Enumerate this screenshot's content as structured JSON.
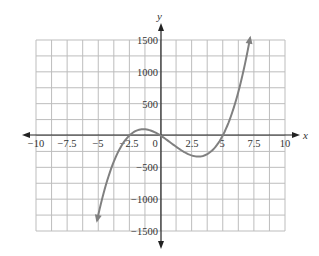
{
  "chart_data": {
    "type": "line",
    "title": "",
    "xlabel": "x",
    "ylabel": "y",
    "xlim": [
      -10,
      10
    ],
    "ylim": [
      -1500,
      1500
    ],
    "grid": true,
    "grid_x_step": 1.25,
    "grid_y_step": 250,
    "x_ticks": [
      -10,
      -7.5,
      -5,
      -2.5,
      0,
      2.5,
      5,
      7.5,
      10
    ],
    "x_tick_labels": [
      "−10",
      "−7.5",
      "−5",
      "−2.5",
      "0",
      "2.5",
      "5",
      "7.5",
      "10"
    ],
    "y_ticks": [
      1500,
      1000,
      500,
      -500,
      -1000,
      -1500
    ],
    "y_tick_labels": [
      "1500",
      "1000",
      "500",
      "−500",
      "−1000",
      "−1500"
    ],
    "legend": [],
    "series": [
      {
        "name": "cubic curve",
        "description": "Cubic with x-intercepts near -2.5, 0 and 5; local max ≈ 100 near x ≈ -1.3, local min ≈ -350 near x ≈ 3.3; arrows at both ends",
        "x": [
          -5.1,
          -5,
          -4,
          -3,
          -2.5,
          -2,
          -1.25,
          -0.5,
          0,
          1,
          2,
          2.5,
          3,
          3.5,
          4,
          5,
          6,
          7,
          7.2
        ],
        "y": [
          -1450,
          -1250,
          -585,
          -135,
          0,
          70,
          98,
          51,
          0,
          -140,
          -270,
          -312,
          -330,
          -315,
          -260,
          0,
          510,
          1330,
          1500
        ]
      }
    ],
    "colors": {
      "curve": "#808080",
      "grid": "#bdbdbd",
      "axes": "#222222"
    }
  },
  "labels": {
    "x_axis": "x",
    "y_axis": "y",
    "x_ticks": [
      "−10",
      "−7.5",
      "−5",
      "−2.5",
      "0",
      "2.5",
      "5",
      "7.5",
      "10"
    ],
    "y_ticks": [
      "1500",
      "1000",
      "500",
      "−500",
      "−1000",
      "−1500"
    ]
  }
}
